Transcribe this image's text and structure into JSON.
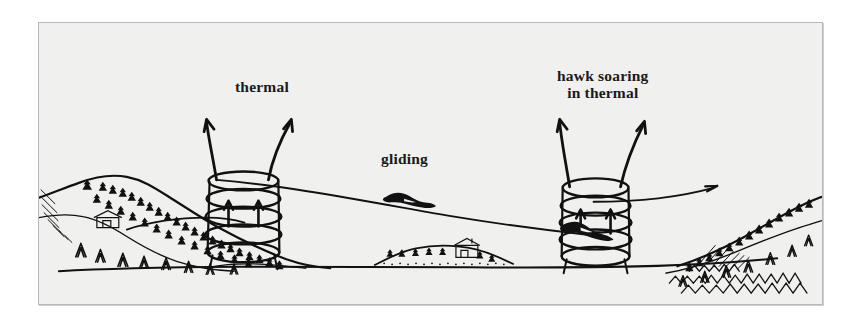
{
  "figure": {
    "kind": "line-illustration",
    "title_in_image": "",
    "background_color": "#f0f0ef",
    "page_color": "#ffffff",
    "border_color": "#b8b8b8",
    "ink_color": "#111111"
  },
  "labels": {
    "thermal": "thermal",
    "gliding": "gliding",
    "hawk_line1": "hawk soaring",
    "hawk_line2": "in thermal"
  },
  "scene": {
    "left_thermal_name": "left-thermal-column",
    "right_thermal_name": "right-thermal-column",
    "glide_path_name": "glide-path-line",
    "horizon_name": "horizon-line",
    "left_ridge_name": "left-mountain-ridge",
    "right_ridge_name": "right-mountain-ridge",
    "center_hill_name": "center-hill-with-farmhouse",
    "gliding_bird_name": "gliding-hawk-silhouette",
    "soaring_bird_name": "soaring-hawk-silhouette"
  }
}
